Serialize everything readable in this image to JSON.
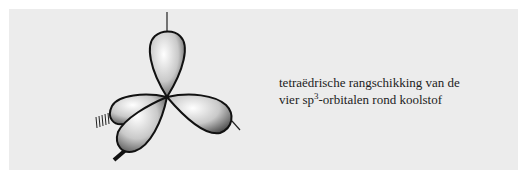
{
  "figure": {
    "name": "sp3 tetrahedral orbitals",
    "lobes": 4,
    "colors": {
      "panel": "#ececec",
      "outline": "#111111",
      "lobe_light": "#ffffff",
      "lobe_dark": "#555555"
    }
  },
  "caption": {
    "line1": "tetraëdrische rangschikking van de",
    "line2_prefix": "vier sp",
    "line2_sup": "3",
    "line2_suffix": "-orbitalen rond koolstof"
  }
}
